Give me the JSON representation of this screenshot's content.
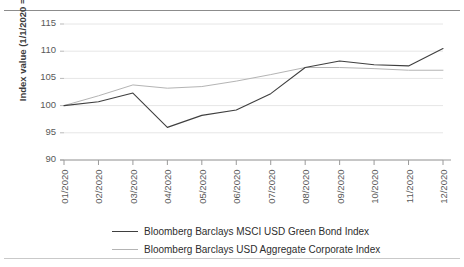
{
  "figure": {
    "clipped_header_text": "",
    "background_color": "#ffffff"
  },
  "chart_data": {
    "type": "line",
    "title": "",
    "subtitle": "",
    "xlabel": "",
    "ylabel": "Index value (1/1/2020 = 100)",
    "categories": [
      "01/2020",
      "02/2020",
      "03/2020",
      "04/2020",
      "05/2020",
      "06/2020",
      "07/2020",
      "08/2020",
      "09/2020",
      "10/2020",
      "11/2020",
      "12/2020"
    ],
    "x_tick_labels": [
      "01/2020",
      "02/2020",
      "03/2020",
      "04/2020",
      "05/2020",
      "06/2020",
      "07/2020",
      "08/2020",
      "09/2020",
      "10/2020",
      "11/2020",
      "12/2020"
    ],
    "y_tick_labels": [
      "115",
      "110",
      "105",
      "100",
      "95",
      "90"
    ],
    "y_ticks": [
      90,
      95,
      100,
      105,
      110,
      115
    ],
    "ylim": [
      90,
      115
    ],
    "grid": true,
    "grid_axis": "y",
    "grid_color": "#e6e6e6",
    "legend_position": "bottom",
    "series": [
      {
        "name": "Bloomberg Barclays MSCI USD Green Bond Index",
        "color": "#3f3f3f",
        "line_width": 1.1,
        "values": [
          100.0,
          100.7,
          102.3,
          96.0,
          98.2,
          99.2,
          102.2,
          107.0,
          108.2,
          107.5,
          107.3,
          110.5
        ]
      },
      {
        "name": "Bloomberg Barclays USD Aggregate Corporate Index",
        "color": "#b4b4b4",
        "line_width": 1.0,
        "values": [
          100.0,
          101.8,
          103.8,
          103.2,
          103.5,
          104.5,
          105.7,
          107.0,
          107.0,
          106.8,
          106.5,
          106.5
        ]
      }
    ]
  },
  "legend": {
    "entries": [
      {
        "label": "Bloomberg Barclays MSCI USD Green Bond Index",
        "color": "#3f3f3f",
        "weight": 1.6
      },
      {
        "label": "Bloomberg Barclays USD Aggregate Corporate Index",
        "color": "#b4b4b4",
        "weight": 1.0
      }
    ]
  }
}
